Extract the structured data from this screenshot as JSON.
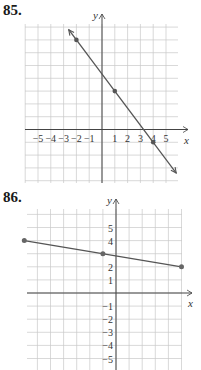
{
  "problems": [
    {
      "number": "85."
    },
    {
      "number": "86."
    }
  ],
  "chart_data": [
    {
      "type": "line",
      "title": "85.",
      "xlabel": "x",
      "ylabel": "y",
      "xlim": [
        -6,
        6
      ],
      "ylim": [
        -4,
        10
      ],
      "x_tick_labels": [
        "−5",
        "−4",
        "−3",
        "−2",
        "−1",
        "1",
        "2",
        "3",
        "4",
        "5"
      ],
      "grid": true,
      "points": [
        {
          "x": -2,
          "y": 7
        },
        {
          "x": 1,
          "y": 3
        },
        {
          "x": 4,
          "y": -1
        }
      ],
      "line": {
        "slope": -1.3333,
        "intercept": 4.3333,
        "arrows": "both"
      },
      "colors": {
        "line": "#555555",
        "grid": "#c8c8c8",
        "axis": "#444444"
      }
    },
    {
      "type": "line",
      "title": "86.",
      "xlabel": "x",
      "ylabel": "y",
      "xlim": [
        -7,
        5
      ],
      "ylim": [
        -6,
        6
      ],
      "y_tick_labels": [
        "5",
        "4",
        "2",
        "1",
        "−1",
        "−2",
        "−3",
        "−4",
        "−5"
      ],
      "grid": true,
      "points": [
        {
          "x": -7,
          "y": 4
        },
        {
          "x": -1,
          "y": 3
        },
        {
          "x": 5,
          "y": 2
        }
      ],
      "line": {
        "slope": -0.1667,
        "intercept": 2.8333,
        "arrows": "none"
      },
      "colors": {
        "line": "#555555",
        "grid": "#c8c8c8",
        "axis": "#444444"
      }
    }
  ]
}
